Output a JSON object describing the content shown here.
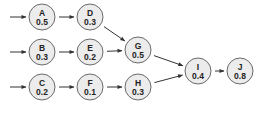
{
  "diagram": {
    "type": "activity-network",
    "colors": {
      "node_fill": "#ececec",
      "node_stroke": "#6a6a6a",
      "edge": "#333333",
      "text": "#222222"
    },
    "nodes": [
      {
        "id": "A",
        "label": "A",
        "value": "0.5",
        "x": 42,
        "y": 17
      },
      {
        "id": "D",
        "label": "D",
        "value": "0.3",
        "x": 90,
        "y": 17
      },
      {
        "id": "B",
        "label": "B",
        "value": "0.3",
        "x": 42,
        "y": 52
      },
      {
        "id": "E",
        "label": "E",
        "value": "0.2",
        "x": 90,
        "y": 52
      },
      {
        "id": "G",
        "label": "G",
        "value": "0.5",
        "x": 138,
        "y": 50
      },
      {
        "id": "C",
        "label": "C",
        "value": "0.2",
        "x": 42,
        "y": 87
      },
      {
        "id": "F",
        "label": "F",
        "value": "0.1",
        "x": 90,
        "y": 87
      },
      {
        "id": "H",
        "label": "H",
        "value": "0.3",
        "x": 138,
        "y": 87
      },
      {
        "id": "I",
        "label": "I",
        "value": "0.4",
        "x": 198,
        "y": 71
      },
      {
        "id": "J",
        "label": "J",
        "value": "0.8",
        "x": 240,
        "y": 71
      }
    ],
    "entry_arrows": [
      {
        "to": "A"
      },
      {
        "to": "B"
      },
      {
        "to": "C"
      }
    ],
    "edges": [
      {
        "from": "A",
        "to": "D"
      },
      {
        "from": "D",
        "to": "G"
      },
      {
        "from": "B",
        "to": "E"
      },
      {
        "from": "E",
        "to": "G"
      },
      {
        "from": "C",
        "to": "F"
      },
      {
        "from": "F",
        "to": "H"
      },
      {
        "from": "G",
        "to": "I"
      },
      {
        "from": "H",
        "to": "I"
      },
      {
        "from": "I",
        "to": "J"
      }
    ]
  }
}
